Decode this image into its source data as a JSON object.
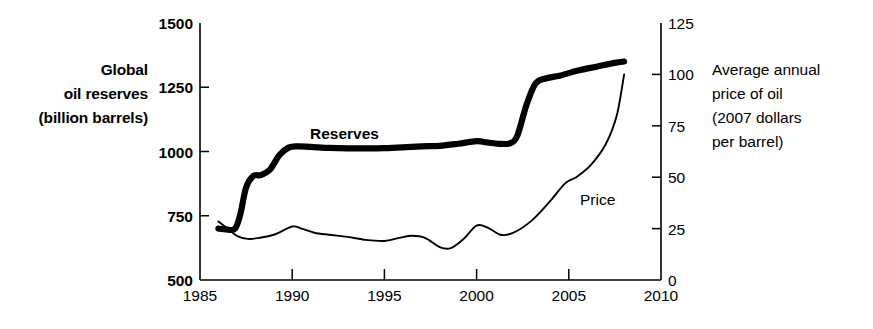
{
  "chart_data": {
    "type": "line",
    "title": "",
    "xlabel": "",
    "ylabel": "Global oil reserves (billion barrels)",
    "y2label": "Average annual price of oil (2007 dollars per barrel)",
    "grid": false,
    "legend_position": "inline-annotations",
    "xlim": [
      1985,
      2010
    ],
    "xticks": [
      "1985",
      "1990",
      "1995",
      "2000",
      "2005",
      "2010"
    ],
    "ylim": [
      500,
      1500
    ],
    "yticks": [
      "500",
      "750",
      "1000",
      "1250",
      "1500"
    ],
    "y2lim": [
      0,
      125
    ],
    "y2ticks": [
      "0",
      "25",
      "50",
      "75",
      "100",
      "125"
    ],
    "series": [
      {
        "name": "Reserves",
        "axis": "left",
        "units": "billion barrels",
        "style": "thick-black",
        "x": [
          1986.0,
          1986.4,
          1986.9,
          1987.2,
          1987.5,
          1987.9,
          1988.3,
          1988.8,
          1989.3,
          1989.8,
          1990.3,
          1991.0,
          1992.0,
          1993.0,
          1994.0,
          1995.0,
          1996.0,
          1997.0,
          1998.0,
          1999.0,
          2000.0,
          2000.6,
          2001.2,
          2001.8,
          2002.2,
          2002.7,
          2003.2,
          2003.8,
          2004.5,
          2005.5,
          2006.5,
          2007.5,
          2008.0
        ],
        "y": [
          700,
          697,
          700,
          760,
          860,
          905,
          908,
          930,
          985,
          1015,
          1020,
          1018,
          1014,
          1012,
          1012,
          1013,
          1016,
          1020,
          1022,
          1030,
          1040,
          1035,
          1030,
          1032,
          1060,
          1180,
          1265,
          1285,
          1295,
          1315,
          1330,
          1345,
          1350
        ]
      },
      {
        "name": "Price",
        "axis": "right",
        "units": "2007 dollars per barrel",
        "style": "thin-black",
        "x": [
          1986.0,
          1986.5,
          1987.0,
          1987.6,
          1988.2,
          1989.0,
          1990.0,
          1990.5,
          1991.2,
          1992.0,
          1993.0,
          1994.0,
          1995.0,
          1995.8,
          1996.5,
          1997.2,
          1998.0,
          1998.6,
          1999.3,
          2000.0,
          2000.6,
          2001.3,
          2002.0,
          2003.0,
          2004.0,
          2004.8,
          2005.4,
          2006.2,
          2007.0,
          2007.6,
          2008.0
        ],
        "y": [
          28.5,
          25.0,
          21.5,
          20.0,
          20.5,
          22.0,
          26.0,
          25.0,
          23.0,
          22.0,
          21.0,
          19.5,
          19.0,
          20.5,
          21.5,
          20.5,
          16.0,
          15.5,
          20.0,
          26.5,
          25.5,
          22.0,
          23.0,
          29.0,
          38.5,
          47.0,
          50.0,
          56.0,
          66.0,
          80.0,
          100.0
        ]
      }
    ],
    "annotations": [
      {
        "text": "Reserves",
        "bold": true,
        "x_px": 310,
        "y_px": 139
      },
      {
        "text": "Price",
        "bold": false,
        "x_px": 580,
        "y_px": 205
      }
    ]
  },
  "labels": {
    "left_axis_title_lines": [
      "Global",
      "oil reserves",
      "(billion barrels)"
    ],
    "right_axis_title_lines": [
      "Average annual",
      "price of oil",
      "(2007 dollars",
      "per barrel)"
    ]
  },
  "colors": {
    "ink": "#000000",
    "background": "#ffffff"
  }
}
